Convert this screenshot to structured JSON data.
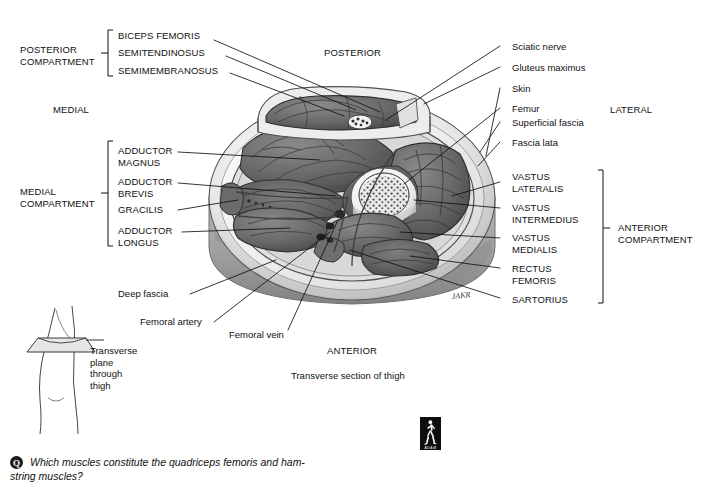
{
  "figure": {
    "title_caption": "Transverse section of thigh",
    "orientation": {
      "posterior": "POSTERIOR",
      "anterior": "ANTERIOR",
      "medial": "MEDIAL",
      "lateral": "LATERAL"
    },
    "compartments": {
      "posterior": [
        "POSTERIOR",
        "COMPARTMENT"
      ],
      "posterior_label": "POSTERIOR\nCOMPARTMENT",
      "medial_label": "MEDIAL\nCOMPARTMENT",
      "anterior_label": "ANTERIOR\nCOMPARTMENT"
    },
    "posterior_muscles": [
      "BICEPS FEMORIS",
      "SEMITENDINOSUS",
      "SEMIMEMBRANOSUS"
    ],
    "medial_muscles": [
      "ADDUCTOR\nMAGNUS",
      "ADDUCTOR\nBREVIS",
      "GRACILIS",
      "ADDUCTOR\nLONGUS"
    ],
    "anterior_muscles": [
      "VASTUS\nLATERALIS",
      "VASTUS\nINTERMEDIUS",
      "VASTUS\nMEDIALIS",
      "RECTUS\nFEMORIS",
      "SARTORIUS"
    ],
    "right_structures": [
      "Sciatic nerve",
      "Gluteus maximus",
      "Skin",
      "Femur",
      "Superficial fascia",
      "Fascia lata"
    ],
    "lower_structures": [
      "Deep fascia",
      "Femoral artery",
      "Femoral vein"
    ],
    "inset": {
      "caption": "Transverse\nplane\nthrough\nthigh"
    },
    "logo": {
      "name": "adam-logo",
      "wordmark": "ADAM"
    }
  },
  "question": {
    "badge": "Q",
    "line1": "Which muscles constitute the quadriceps femoris and ham-",
    "line2": "string muscles?"
  },
  "colors": {
    "ink": "#111111",
    "muscle_dark": "#5d5d5d",
    "muscle_mid": "#7a7a7a",
    "fascia_light": "#e2e2e2",
    "fat_light": "#f0f0f0",
    "bone": "#efefef",
    "skin_edge": "#bdbdbd",
    "shadow": "#9a9a9a"
  }
}
